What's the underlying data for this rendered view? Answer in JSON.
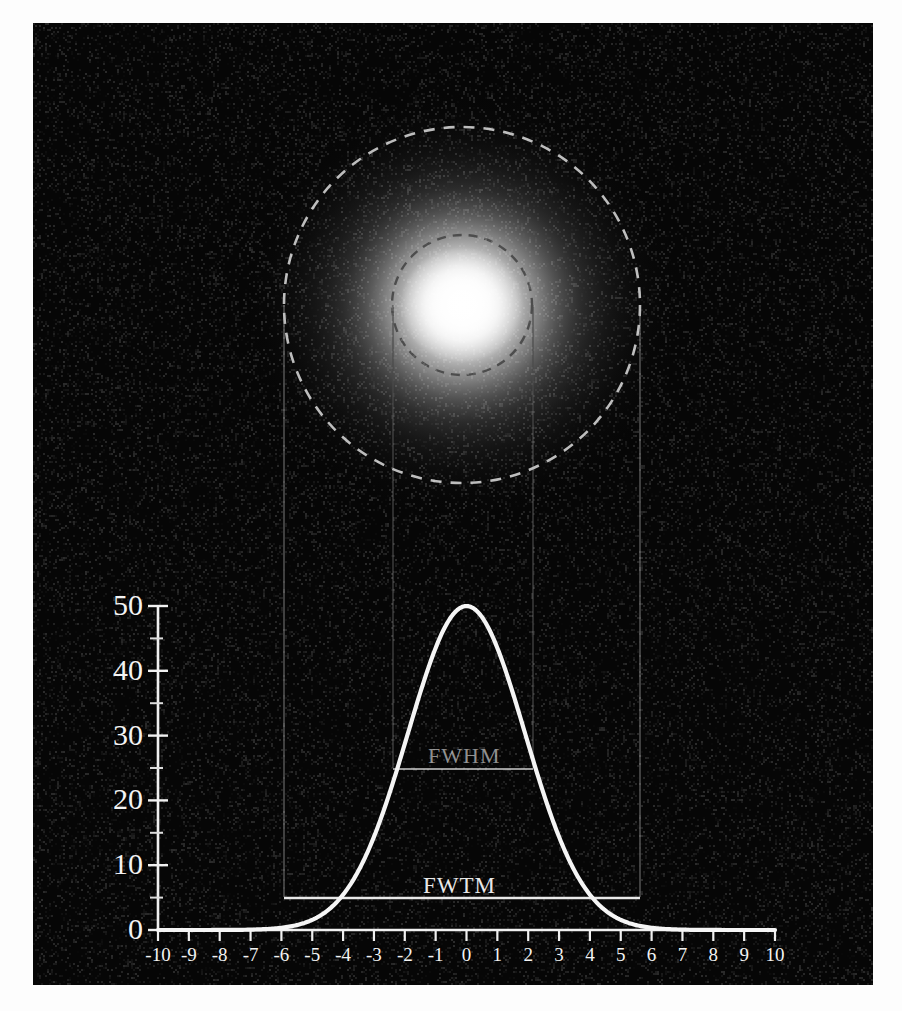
{
  "figure": {
    "background_color": "#060606",
    "panel": {
      "x": 33,
      "y": 23,
      "width": 840,
      "height": 962
    },
    "curve_color": "#f5f5f5",
    "axis_color": "#f0f0f0"
  },
  "chart_data": {
    "type": "line",
    "title": "",
    "subtitle": "",
    "xlabel": "",
    "ylabel": "",
    "xlim": [
      -10,
      10
    ],
    "ylim": [
      0,
      50
    ],
    "grid": false,
    "legend": "none",
    "x_tick_labels": [
      "-10",
      "-9",
      "-8",
      "-7",
      "-6",
      "-5",
      "-4",
      "-3",
      "-2",
      "-1",
      "0",
      "1",
      "2",
      "3",
      "4",
      "5",
      "6",
      "7",
      "8",
      "9",
      "10"
    ],
    "x_ticks": [
      -10,
      -9,
      -8,
      -7,
      -6,
      -5,
      -4,
      -3,
      -2,
      -1,
      0,
      1,
      2,
      3,
      4,
      5,
      6,
      7,
      8,
      9,
      10
    ],
    "y_tick_labels": [
      "0",
      "10",
      "20",
      "30",
      "40",
      "50"
    ],
    "y_ticks": [
      0,
      10,
      20,
      30,
      40,
      50
    ],
    "y_minor_ticks": [
      5,
      15,
      25,
      35,
      45
    ],
    "series": [
      {
        "name": "gaussian",
        "function": "gaussian",
        "amplitude": 50,
        "mean": 0,
        "sigma": 1.9,
        "color": "#f5f5f5",
        "x": [
          -10,
          -9.5,
          -9,
          -8.5,
          -8,
          -7.5,
          -7,
          -6.5,
          -6,
          -5.5,
          -5,
          -4.5,
          -4,
          -3.5,
          -3,
          -2.5,
          -2,
          -1.5,
          -1,
          -0.5,
          0,
          0.5,
          1,
          1.5,
          2,
          2.5,
          3,
          3.5,
          4,
          4.5,
          5,
          5.5,
          6,
          6.5,
          7,
          7.5,
          8,
          8.5,
          9,
          9.5,
          10
        ],
        "y": [
          0.03,
          0.07,
          0.15,
          0.3,
          0.59,
          1.1,
          1.97,
          3.37,
          5.52,
          8.66,
          13.0,
          18.7,
          25.8,
          34.1,
          43.2,
          48.0,
          50.0,
          48.0,
          43.2,
          34.1,
          50.0,
          34.1,
          43.2,
          48.0,
          50.0,
          48.0,
          43.2,
          34.1,
          25.8,
          18.7,
          13.0,
          8.66,
          5.52,
          3.37,
          1.97,
          1.1,
          0.59,
          0.3,
          0.15,
          0.07,
          0.03
        ]
      }
    ],
    "annotations": [
      {
        "id": "fwhm",
        "label": "FWHM",
        "y_value": 25,
        "x_from": -2.24,
        "x_to": 2.24,
        "width": 4.47,
        "color": "#8f8f8f"
      },
      {
        "id": "fwtm",
        "label": "FWTM",
        "y_value": 5,
        "x_from": -5.77,
        "x_to": 5.77,
        "width": 11.54,
        "color": "#e8e8e8"
      }
    ]
  },
  "psf_image": {
    "name": "gaussian-point-spread-function",
    "center_x_px": 462,
    "center_y_px": 305,
    "circles": [
      {
        "id": "fwtm-circle",
        "label": "FWTM",
        "radius_px": 178,
        "style": "dashed",
        "color": "#b9b9b9"
      },
      {
        "id": "fwhm-circle",
        "label": "FWHM",
        "radius_px": 70,
        "style": "dashed",
        "color": "#4a4a4a"
      }
    ]
  },
  "connectors": {
    "fwtm_left_x": 284,
    "fwtm_right_x": 640,
    "fwhm_left_x": 393,
    "fwhm_right_x": 533,
    "color": "#5b5b5b"
  }
}
